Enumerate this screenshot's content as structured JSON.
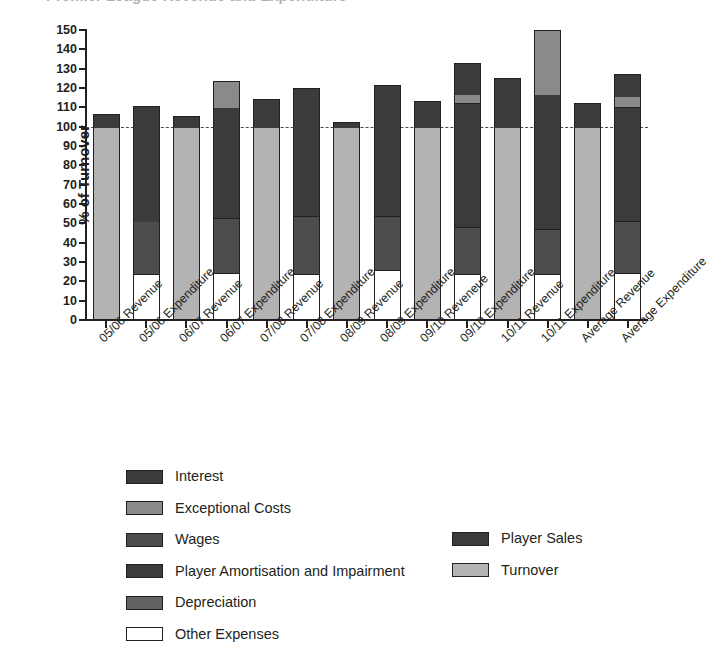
{
  "figure": {
    "title_clipped": "Premier League Revenue and Expenditure"
  },
  "axis": {
    "y_title": "% of Turnover",
    "y_ticks": [
      0,
      10,
      20,
      30,
      40,
      50,
      60,
      70,
      80,
      90,
      100,
      110,
      120,
      130,
      140,
      150
    ],
    "y_min": 0,
    "y_max": 150,
    "reference_line_value": 100
  },
  "colors": {
    "turnover": "#b3b3b3",
    "player_sales": "#3b3b3b",
    "interest": "#3b3b3b",
    "exceptional_costs": "#8a8a8a",
    "wages": "#4d4d4d",
    "player_amortisation": "#3b3b3b",
    "depreciation": "#636363",
    "other_expenses": "#ffffff",
    "outline": "#231f20",
    "background": "#ffffff"
  },
  "legend": {
    "left_items": [
      {
        "label": "Interest",
        "key": "interest",
        "color": "#3b3b3b"
      },
      {
        "label": "Exceptional Costs",
        "key": "exceptional_costs",
        "color": "#8a8a8a"
      },
      {
        "label": "Wages",
        "key": "wages",
        "color": "#4d4d4d"
      },
      {
        "label": "Player Amortisation and Impairment",
        "key": "player_amortisation",
        "color": "#3b3b3b"
      },
      {
        "label": "Depreciation",
        "key": "depreciation",
        "color": "#636363"
      },
      {
        "label": "Other Expenses",
        "key": "other_expenses",
        "color": "#ffffff"
      }
    ],
    "right_items": [
      {
        "label": "Player Sales",
        "key": "player_sales",
        "color": "#3b3b3b"
      },
      {
        "label": "Turnover",
        "key": "turnover",
        "color": "#b3b3b3"
      }
    ]
  },
  "chart_data": {
    "type": "bar",
    "subtype": "stacked",
    "title": "Premier League Revenue and Expenditure",
    "xlabel": "",
    "ylabel": "% of Turnover",
    "ylim": [
      0,
      150
    ],
    "ytick_step": 10,
    "grid": false,
    "legend_position": "bottom",
    "reference_line": 100,
    "categories": [
      "05/06 Revenue",
      "05/06 Expenditure",
      "06/07 Revenue",
      "06/07 Expenditure",
      "07/08 Revenue",
      "07/08 Expenditure",
      "08/09 Revenue",
      "08/09 Expenditure",
      "09/10 Reveneue",
      "09/10 Expenditure",
      "10/11 Revenue",
      "10/11 Expenditure",
      "Average Revenue",
      "Average Expenditure"
    ],
    "series": [
      {
        "name": "Turnover",
        "key": "turnover",
        "values": [
          100,
          0,
          100,
          0,
          100,
          0,
          100,
          0,
          100,
          0,
          100,
          0,
          100,
          0
        ]
      },
      {
        "name": "Player Sales",
        "key": "player_sales",
        "values": [
          6.5,
          0,
          5.5,
          0,
          14.5,
          0,
          2.5,
          0,
          13.5,
          0,
          25,
          0,
          11.5,
          0
        ]
      },
      {
        "name": "Other Expenses",
        "key": "other_expenses",
        "values": [
          0,
          24,
          0,
          24.5,
          0,
          24,
          0,
          26,
          0,
          24,
          0,
          24,
          0,
          24.5
        ]
      },
      {
        "name": "Wages",
        "key": "wages",
        "values": [
          0,
          27,
          0,
          28,
          0,
          30,
          0,
          28,
          0,
          24,
          0,
          23,
          0,
          26.5
        ]
      },
      {
        "name": "Player Amortisation and Impairment",
        "key": "player_amortisation",
        "values": [
          0,
          59.5,
          0,
          57.5,
          0,
          56,
          0,
          48.5,
          0,
          64,
          0,
          70,
          0,
          59
        ]
      },
      {
        "name": "Exceptional Costs",
        "key": "exceptional_costs",
        "values": [
          0,
          0,
          0,
          13.5,
          0,
          0,
          0,
          0,
          0,
          5,
          0,
          33,
          0,
          6
        ]
      },
      {
        "name": "Depreciation",
        "key": "depreciation",
        "values": [
          0,
          0,
          0,
          0,
          0,
          0,
          0,
          0,
          0,
          0,
          0,
          0,
          0,
          0
        ]
      },
      {
        "name": "Interest",
        "key": "interest",
        "values": [
          0,
          0,
          0,
          0,
          0,
          10,
          0,
          19,
          0,
          16,
          0,
          0,
          0,
          11
        ]
      }
    ],
    "bar_totals": [
      106.5,
      110.5,
      105.5,
      123.5,
      114.5,
      120,
      102.5,
      121.5,
      113.5,
      133,
      125,
      150,
      112,
      127
    ]
  },
  "bars": [
    {
      "label": "05/06 Revenue",
      "total": 106.5,
      "segments": [
        {
          "key": "turnover",
          "from": 0,
          "to": 100,
          "color": "#b3b3b3"
        },
        {
          "key": "player_sales",
          "from": 100,
          "to": 106.5,
          "color": "#3b3b3b"
        }
      ]
    },
    {
      "label": "05/06 Expenditure",
      "total": 110.5,
      "segments": [
        {
          "key": "other_expenses",
          "from": 0,
          "to": 24,
          "color": "#ffffff"
        },
        {
          "key": "wages",
          "from": 24,
          "to": 51,
          "color": "#4d4d4d"
        },
        {
          "key": "player_amortisation",
          "from": 51,
          "to": 110.5,
          "color": "#3b3b3b"
        }
      ]
    },
    {
      "label": "06/07 Revenue",
      "total": 105.5,
      "segments": [
        {
          "key": "turnover",
          "from": 0,
          "to": 100,
          "color": "#b3b3b3"
        },
        {
          "key": "player_sales",
          "from": 100,
          "to": 105.5,
          "color": "#3b3b3b"
        }
      ]
    },
    {
      "label": "06/07 Expenditure",
      "total": 123.5,
      "segments": [
        {
          "key": "other_expenses",
          "from": 0,
          "to": 24.5,
          "color": "#ffffff"
        },
        {
          "key": "wages",
          "from": 24.5,
          "to": 52.5,
          "color": "#4d4d4d"
        },
        {
          "key": "player_amortisation",
          "from": 52.5,
          "to": 110,
          "color": "#3b3b3b"
        },
        {
          "key": "exceptional_costs",
          "from": 110,
          "to": 123.5,
          "color": "#8a8a8a"
        }
      ]
    },
    {
      "label": "07/08 Revenue",
      "total": 114.5,
      "segments": [
        {
          "key": "turnover",
          "from": 0,
          "to": 100,
          "color": "#b3b3b3"
        },
        {
          "key": "player_sales",
          "from": 100,
          "to": 114.5,
          "color": "#3b3b3b"
        }
      ]
    },
    {
      "label": "07/08 Expenditure",
      "total": 120,
      "segments": [
        {
          "key": "other_expenses",
          "from": 0,
          "to": 24,
          "color": "#ffffff"
        },
        {
          "key": "wages",
          "from": 24,
          "to": 54,
          "color": "#4d4d4d"
        },
        {
          "key": "player_amortisation",
          "from": 54,
          "to": 110,
          "color": "#3b3b3b"
        },
        {
          "key": "interest",
          "from": 110,
          "to": 120,
          "color": "#3b3b3b"
        }
      ]
    },
    {
      "label": "08/09 Revenue",
      "total": 102.5,
      "segments": [
        {
          "key": "turnover",
          "from": 0,
          "to": 100,
          "color": "#b3b3b3"
        },
        {
          "key": "player_sales",
          "from": 100,
          "to": 102.5,
          "color": "#3b3b3b"
        }
      ]
    },
    {
      "label": "08/09 Expenditure",
      "total": 121.5,
      "segments": [
        {
          "key": "other_expenses",
          "from": 0,
          "to": 26,
          "color": "#ffffff"
        },
        {
          "key": "wages",
          "from": 26,
          "to": 54,
          "color": "#4d4d4d"
        },
        {
          "key": "player_amortisation",
          "from": 54,
          "to": 102.5,
          "color": "#3b3b3b"
        },
        {
          "key": "interest",
          "from": 102.5,
          "to": 121.5,
          "color": "#3b3b3b"
        }
      ]
    },
    {
      "label": "09/10 Reveneue",
      "total": 113.5,
      "segments": [
        {
          "key": "turnover",
          "from": 0,
          "to": 100,
          "color": "#b3b3b3"
        },
        {
          "key": "player_sales",
          "from": 100,
          "to": 113.5,
          "color": "#3b3b3b"
        }
      ]
    },
    {
      "label": "09/10 Expenditure",
      "total": 133,
      "segments": [
        {
          "key": "other_expenses",
          "from": 0,
          "to": 24,
          "color": "#ffffff"
        },
        {
          "key": "wages",
          "from": 24,
          "to": 48,
          "color": "#4d4d4d"
        },
        {
          "key": "player_amortisation",
          "from": 48,
          "to": 112,
          "color": "#3b3b3b"
        },
        {
          "key": "exceptional_costs",
          "from": 112,
          "to": 117,
          "color": "#8a8a8a"
        },
        {
          "key": "interest",
          "from": 117,
          "to": 133,
          "color": "#3b3b3b"
        }
      ]
    },
    {
      "label": "10/11 Revenue",
      "total": 125,
      "segments": [
        {
          "key": "turnover",
          "from": 0,
          "to": 100,
          "color": "#b3b3b3"
        },
        {
          "key": "player_sales",
          "from": 100,
          "to": 125,
          "color": "#3b3b3b"
        }
      ]
    },
    {
      "label": "10/11 Expenditure",
      "total": 150,
      "segments": [
        {
          "key": "other_expenses",
          "from": 0,
          "to": 24,
          "color": "#ffffff"
        },
        {
          "key": "wages",
          "from": 24,
          "to": 47,
          "color": "#4d4d4d"
        },
        {
          "key": "player_amortisation",
          "from": 47,
          "to": 117,
          "color": "#3b3b3b"
        },
        {
          "key": "exceptional_costs",
          "from": 117,
          "to": 150,
          "color": "#8a8a8a"
        }
      ]
    },
    {
      "label": "Average Revenue",
      "total": 112,
      "segments": [
        {
          "key": "turnover",
          "from": 0,
          "to": 100,
          "color": "#b3b3b3"
        },
        {
          "key": "player_sales",
          "from": 100,
          "to": 112,
          "color": "#3b3b3b"
        }
      ]
    },
    {
      "label": "Average Expenditure",
      "total": 127,
      "segments": [
        {
          "key": "other_expenses",
          "from": 0,
          "to": 24.5,
          "color": "#ffffff"
        },
        {
          "key": "wages",
          "from": 24.5,
          "to": 51,
          "color": "#4d4d4d"
        },
        {
          "key": "player_amortisation",
          "from": 51,
          "to": 110,
          "color": "#3b3b3b"
        },
        {
          "key": "exceptional_costs",
          "from": 110,
          "to": 116,
          "color": "#8a8a8a"
        },
        {
          "key": "interest",
          "from": 116,
          "to": 127,
          "color": "#3b3b3b"
        }
      ]
    }
  ]
}
